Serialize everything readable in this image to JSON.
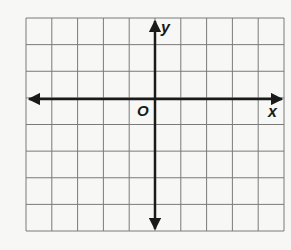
{
  "diagram": {
    "type": "coordinate-plane",
    "grid": {
      "columns": 10,
      "rows": 8,
      "left": 26,
      "top": 18,
      "right": 284,
      "bottom": 231
    },
    "origin_column": 5,
    "origin_row": 3,
    "labels": {
      "x_axis": "x",
      "y_axis": "y",
      "origin": "O"
    },
    "colors": {
      "grid": "#7a7a7a",
      "axis": "#1a1a1a",
      "background": "#f7f7f5"
    }
  }
}
